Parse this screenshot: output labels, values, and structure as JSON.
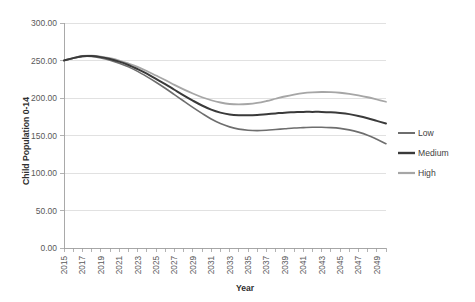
{
  "chart_data": {
    "type": "line",
    "title": "",
    "xlabel": "Year",
    "ylabel": "Child Population 0-14",
    "xlim": [
      2015,
      2050
    ],
    "ylim": [
      0,
      300
    ],
    "grid": true,
    "legend_position": "right",
    "y_ticks": [
      "0.00",
      "50.00",
      "100.00",
      "150.00",
      "200.00",
      "250.00",
      "300.00"
    ],
    "y_tick_values": [
      0,
      50,
      100,
      150,
      200,
      250,
      300
    ],
    "x_tick_labels": [
      "2015",
      "2017",
      "2019",
      "2021",
      "2023",
      "2025",
      "2027",
      "2029",
      "2031",
      "2033",
      "2035",
      "2037",
      "2039",
      "2041",
      "2043",
      "2045",
      "2047",
      "2049"
    ],
    "x_minor_step_years": 1,
    "x": [
      2015,
      2016,
      2017,
      2018,
      2019,
      2020,
      2021,
      2022,
      2023,
      2024,
      2025,
      2026,
      2027,
      2028,
      2029,
      2030,
      2031,
      2032,
      2033,
      2034,
      2035,
      2036,
      2037,
      2038,
      2039,
      2040,
      2041,
      2042,
      2043,
      2044,
      2045,
      2046,
      2047,
      2048,
      2049,
      2050
    ],
    "series": [
      {
        "name": "Low",
        "color": "#6e6e6e",
        "width": 1.6,
        "values": [
          250.0,
          253.0,
          255.5,
          255.5,
          253.5,
          250.5,
          246.5,
          241.5,
          235.5,
          228.5,
          221.0,
          213.0,
          204.5,
          196.0,
          187.5,
          179.5,
          172.0,
          166.0,
          161.5,
          158.5,
          157.0,
          156.5,
          157.0,
          158.0,
          159.0,
          160.0,
          160.5,
          161.0,
          161.0,
          160.5,
          159.5,
          157.5,
          154.5,
          150.5,
          145.0,
          139.0
        ]
      },
      {
        "name": "Medium",
        "color": "#3a3a3a",
        "width": 2.0,
        "values": [
          250.0,
          253.2,
          255.8,
          256.0,
          254.5,
          252.0,
          248.5,
          244.0,
          238.5,
          232.5,
          225.5,
          218.5,
          211.0,
          203.5,
          196.5,
          190.0,
          184.5,
          180.5,
          178.0,
          177.0,
          177.0,
          177.5,
          178.5,
          179.5,
          180.5,
          181.0,
          181.5,
          181.5,
          181.5,
          181.0,
          180.0,
          178.5,
          176.0,
          173.0,
          169.5,
          166.0
        ]
      },
      {
        "name": "High",
        "color": "#a6a6a6",
        "width": 1.8,
        "values": [
          250.0,
          253.3,
          256.0,
          256.3,
          255.2,
          253.0,
          250.0,
          246.0,
          241.5,
          236.0,
          230.0,
          224.0,
          217.5,
          211.5,
          206.0,
          201.0,
          197.0,
          194.0,
          192.0,
          191.5,
          192.0,
          193.5,
          196.0,
          199.0,
          202.0,
          204.5,
          206.5,
          207.5,
          208.0,
          207.8,
          207.0,
          205.5,
          203.5,
          201.0,
          198.0,
          195.0
        ]
      }
    ],
    "style": {
      "gridline_color": "#d9d9d9",
      "axis_color": "#a0a0a0",
      "tick_label_color": "#595959",
      "axis_title_color": "#2f2f2f",
      "background": "#ffffff"
    }
  }
}
